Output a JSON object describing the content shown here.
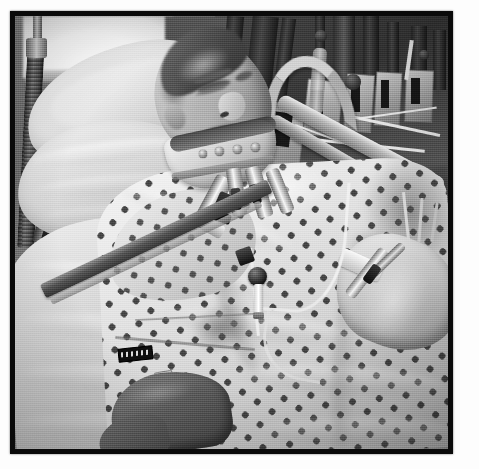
{
  "image": {
    "kind": "photograph",
    "medium": "grayscale-photo",
    "presentation": "single photo with thick black frame on white page",
    "caption_visible": "",
    "scene": "hospital-intensive-care-unit",
    "subject": "adult male patient lying in an ICU bed",
    "colors": {
      "page_background": "#fdfdfd",
      "frame": "#0a0a0a",
      "photo_midtone": "#8c8c8c",
      "highlight": "#f4f4f4",
      "shadow": "#2b2b2b"
    },
    "frame": {
      "outer_margin_px": 10,
      "border_width_px": 5,
      "photo_width_px": 433,
      "photo_height_px": 433
    },
    "elements": [
      {
        "name": "window",
        "label": "bright window",
        "position": "upper-left"
      },
      {
        "name": "ventilator-hose",
        "label": "corrugated ventilator hose",
        "position": "left-edge, vertical"
      },
      {
        "name": "pillow-upper",
        "label": "white pillow behind head",
        "position": "upper-left"
      },
      {
        "name": "pillow-lower",
        "label": "second pillow / folded linen",
        "position": "left-middle"
      },
      {
        "name": "blanket",
        "label": "white blanket",
        "position": "lower-left"
      },
      {
        "name": "patient-head",
        "label": "patient's head in profile, eyes closed",
        "position": "upper-center-left"
      },
      {
        "name": "cervical-collar",
        "label": "cervical collar neck brace with snap fasteners",
        "position": "center-upper"
      },
      {
        "name": "hospital-gown",
        "label": "hospital gown with dark diamond dot print",
        "position": "center and lower-right"
      },
      {
        "name": "chest-tubes",
        "label": "tubes and connectors at the neck and chest",
        "position": "center"
      },
      {
        "name": "chest-port",
        "label": "dark port bulb with white stem on the chest",
        "position": "center"
      },
      {
        "name": "iv-line",
        "label": "thin IV line curving down the gown",
        "position": "center to lower-right"
      },
      {
        "name": "left-forearm",
        "label": "patient's forearm, darker skin tone",
        "position": "lower-center-left"
      },
      {
        "name": "right-arm",
        "label": "patient's other arm with taped IV site",
        "position": "right"
      },
      {
        "name": "bed-side-rail",
        "label": "chrome bed side rail with hooked end",
        "position": "upper-right, diagonal"
      },
      {
        "name": "medical-equipment",
        "label": "dark cluttered ICU equipment, poles and monitors",
        "position": "background upper-right"
      },
      {
        "name": "restraint-strap",
        "label": "dark diagonal strap / tubing across the blanket",
        "position": "left-lower, diagonal"
      },
      {
        "name": "label-clip",
        "label": "small dark label clip with illegible markings",
        "position": "lower-left-center"
      }
    ],
    "alt_text": "Black and white photograph of a man lying in a hospital intensive care bed. He is wearing a cervical collar and a patterned hospital gown, with ventilator tubing, intravenous lines and a chest port visible. White pillows support his head, a chrome bed rail curves across the upper right, and dark medical equipment fills the background."
  }
}
